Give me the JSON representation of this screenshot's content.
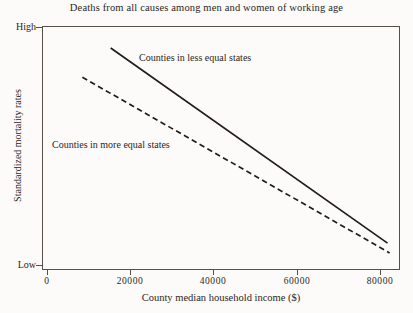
{
  "chart_data": {
    "type": "line",
    "title": "Deaths from all causes among men and women of working age",
    "xlabel": "County median household income ($)",
    "ylabel": "Standardized mortality rates",
    "xlim": [
      0,
      86000
    ],
    "ylim": [
      0,
      100
    ],
    "xticks": [
      {
        "value": 0,
        "label": "0"
      },
      {
        "value": 20000,
        "label": "20000"
      },
      {
        "value": 40000,
        "label": "40000"
      },
      {
        "value": 60000,
        "label": "60000"
      },
      {
        "value": 80000,
        "label": "80000"
      }
    ],
    "yticks": [
      {
        "value": 100,
        "label": "High"
      },
      {
        "value": 0,
        "label": "Low"
      }
    ],
    "grid": false,
    "legend_position": "inline-annotations",
    "series": [
      {
        "name": "Counties in less equal states",
        "style": "solid",
        "color": "#211d1a",
        "annotation": "Counties in less equal states",
        "x": [
          16500,
          83000
        ],
        "y": [
          91,
          11
        ]
      },
      {
        "name": "Counties in more equal states",
        "style": "dashed",
        "color": "#211d1a",
        "annotation": "Counties in more equal states",
        "x": [
          9700,
          83500
        ],
        "y": [
          79,
          7
        ]
      }
    ]
  },
  "chart": {
    "title": "Deaths from all causes among men and women of working age",
    "x_axis_label": "County median household income ($)",
    "y_axis_label": "Standardized mortality rates",
    "x_tick_labels": [
      "0",
      "20000",
      "40000",
      "60000",
      "80000"
    ],
    "y_tick_high": "High",
    "y_tick_low": "Low",
    "series_label_less_equal": "Counties in less equal states",
    "series_label_more_equal": "Counties in more equal states",
    "line_color": "#211d1a",
    "frame_color": "#565049",
    "background_color": "#fcfbfa"
  }
}
